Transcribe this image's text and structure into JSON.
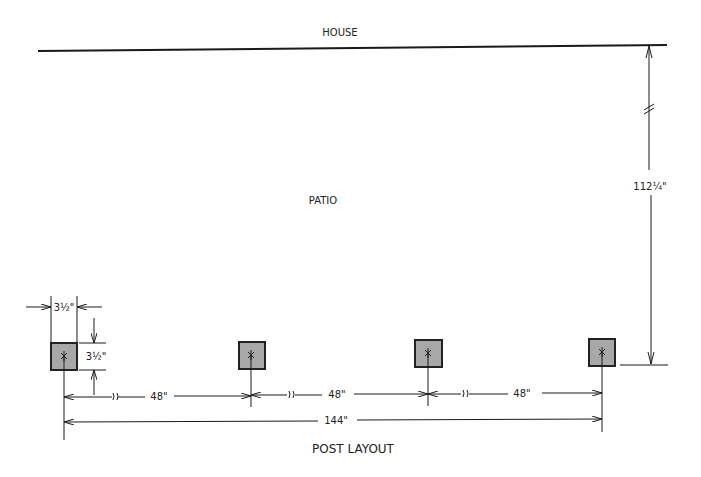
{
  "labels": {
    "house": "HOUSE",
    "patio": "PATIO",
    "title": "POST LAYOUT"
  },
  "dimensions": {
    "post_width": "3½\"",
    "post_depth": "3½\"",
    "spacing_1": "48\"",
    "spacing_2": "48\"",
    "spacing_3": "48\"",
    "overall": "144\"",
    "house_to_posts": "112¼\""
  },
  "colors": {
    "line": "#1a1a1a",
    "post_fill": "#a8a8a8",
    "post_stroke": "#222222",
    "background": "#ffffff"
  },
  "posts": [
    {
      "id": 1,
      "x": 64,
      "y": 357
    },
    {
      "id": 2,
      "x": 251,
      "y": 355
    },
    {
      "id": 3,
      "x": 428,
      "y": 353
    },
    {
      "id": 4,
      "x": 602,
      "y": 352
    }
  ]
}
